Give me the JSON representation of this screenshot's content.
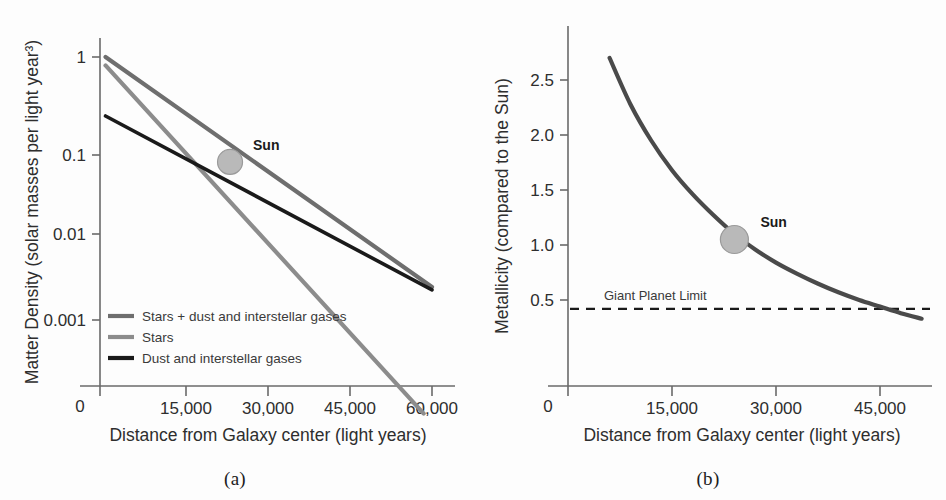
{
  "figure": {
    "panels": [
      {
        "id": "a",
        "caption": "(a)",
        "sun_label": "Sun"
      },
      {
        "id": "b",
        "caption": "(b)",
        "sun_label": "Sun",
        "annotation": "Giant Planet Limit"
      }
    ]
  },
  "chart_data": [
    {
      "type": "line",
      "panel": "a",
      "title": "",
      "xlabel": "Distance from Galaxy center (light years)",
      "ylabel": "Matter Density (solar masses per light year³)",
      "xlim": [
        0,
        63000
      ],
      "ylim": [
        0.0002,
        1.3
      ],
      "yscale": "log",
      "xticks": [
        0,
        15000,
        30000,
        45000,
        60000
      ],
      "xticklabels": [
        "0",
        "15,000",
        "30,000",
        "45,000",
        "60,000"
      ],
      "yticks": [
        1,
        0.1,
        0.01,
        0.001
      ],
      "yticklabels": [
        "1",
        "0.1",
        "0.01",
        "0.001"
      ],
      "grid": false,
      "legend_position": "lower-left",
      "series": [
        {
          "name": "Stars + dust and interstellar gases",
          "color": "#6e6e6e",
          "x": [
            1000,
            60000
          ],
          "values": [
            1.0,
            0.0045
          ]
        },
        {
          "name": "Stars",
          "color": "#8c8c8c",
          "x": [
            1000,
            58500
          ],
          "values": [
            0.82,
            0.00023
          ]
        },
        {
          "name": "Dust and interstellar gases",
          "color": "#1a1a1a",
          "x": [
            1000,
            60000
          ],
          "values": [
            0.25,
            0.0042
          ]
        }
      ],
      "annotations": [
        {
          "label": "Sun",
          "x": 23500,
          "y": 0.085,
          "marker": "filled-circle",
          "marker_color": "#b9b9b9"
        }
      ]
    },
    {
      "type": "line",
      "panel": "b",
      "title": "",
      "xlabel": "Distance from Galaxy center (light years)",
      "ylabel": "Metallicity (compared to the Sun)",
      "xlim": [
        0,
        52000
      ],
      "ylim": [
        0,
        2.95
      ],
      "yscale": "linear",
      "xticks": [
        0,
        15000,
        30000,
        45000
      ],
      "xticklabels": [
        "0",
        "15,000",
        "30,000",
        "45,000"
      ],
      "yticks": [
        0.5,
        1.0,
        1.5,
        2.0,
        2.5
      ],
      "yticklabels": [
        "0.5",
        "1.0",
        "1.5",
        "2.0",
        "2.5"
      ],
      "grid": false,
      "series": [
        {
          "name": "Metallicity",
          "color": "#4a4a4a",
          "x": [
            6000,
            9000,
            12000,
            15000,
            18000,
            21000,
            24000,
            27000,
            30000,
            33000,
            36000,
            39000,
            42000,
            45000,
            48000,
            51000
          ],
          "values": [
            2.7,
            2.28,
            1.95,
            1.68,
            1.46,
            1.27,
            1.1,
            0.96,
            0.84,
            0.74,
            0.65,
            0.57,
            0.5,
            0.44,
            0.38,
            0.33
          ]
        }
      ],
      "reference_lines": [
        {
          "label": "Giant Planet Limit",
          "y": 0.42,
          "style": "dashed",
          "color": "#1a1a1a"
        }
      ],
      "annotations": [
        {
          "label": "Sun",
          "x": 24000,
          "y": 1.05,
          "marker": "filled-circle",
          "marker_color": "#b9b9b9"
        }
      ]
    }
  ]
}
